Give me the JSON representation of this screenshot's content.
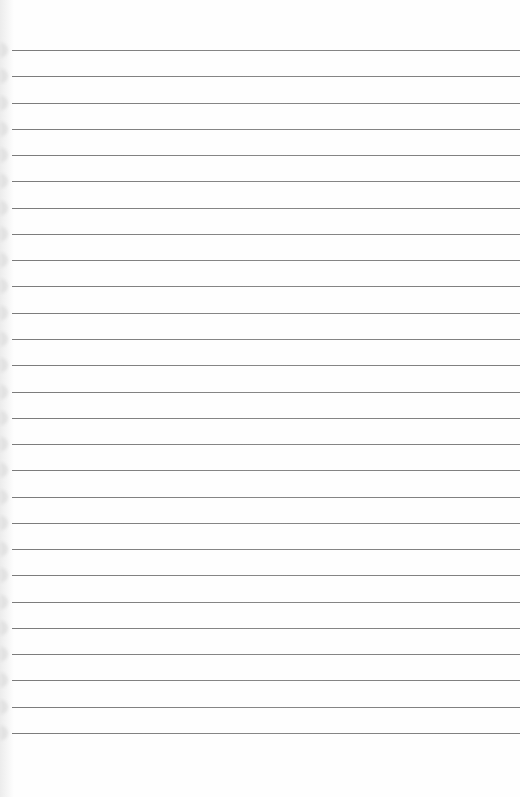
{
  "paper": {
    "background": "#fefefe",
    "rule_color": "#707070",
    "rule_count": 27,
    "first_rule_y": 50,
    "rule_spacing": 26.27,
    "rule_left_x": 12
  },
  "content": {
    "text": ""
  }
}
